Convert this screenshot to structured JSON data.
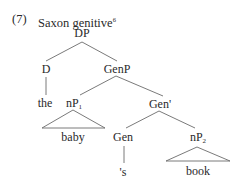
{
  "example": {
    "number": "(7)",
    "title": "Saxon genitive",
    "footnote": "6"
  },
  "tree": {
    "root": "DP",
    "nodes": {
      "D": "D",
      "GenP": "GenP",
      "the": "the",
      "nP1_base": "nP",
      "nP1_sub": "1",
      "GenBar": "Gen'",
      "baby": "baby",
      "Gen": "Gen",
      "nP2_base": "nP",
      "nP2_sub": "2",
      "s": "'s",
      "book": "book"
    },
    "edges": [
      [
        "DP",
        "D"
      ],
      [
        "DP",
        "GenP"
      ],
      [
        "D",
        "the"
      ],
      [
        "GenP",
        "nP1"
      ],
      [
        "GenP",
        "GenBar"
      ],
      [
        "nP1",
        "baby (triangle)"
      ],
      [
        "GenBar",
        "Gen"
      ],
      [
        "GenBar",
        "nP2"
      ],
      [
        "Gen",
        "'s"
      ],
      [
        "nP2",
        "book (triangle)"
      ]
    ]
  },
  "colors": {
    "text": "#2a2a2a",
    "line": "#6b6b6b"
  }
}
